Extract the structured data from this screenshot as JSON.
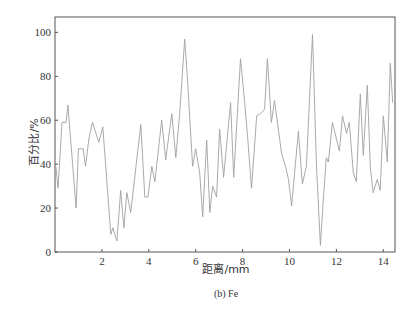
{
  "chart_data": {
    "type": "line",
    "title": "",
    "caption": "(b) Fe",
    "xlabel": "距离/mm",
    "ylabel": "百分比/%",
    "xlim": [
      0,
      14.5
    ],
    "ylim": [
      0,
      107
    ],
    "xticks": [
      2,
      4,
      6,
      8,
      10,
      12,
      14
    ],
    "yticks": [
      0,
      20,
      40,
      60,
      80,
      100
    ],
    "grid": false,
    "legend": null,
    "line_color": "#a0a0a0",
    "axis_color": "#555555",
    "series": [
      {
        "name": "Fe",
        "x": [
          0.04,
          0.13,
          0.3,
          0.47,
          0.55,
          0.9,
          1.0,
          1.2,
          1.3,
          1.45,
          1.6,
          1.87,
          2.04,
          2.38,
          2.47,
          2.64,
          2.8,
          2.94,
          3.06,
          3.23,
          3.66,
          3.83,
          3.96,
          4.13,
          4.26,
          4.55,
          4.72,
          4.98,
          5.15,
          5.32,
          5.53,
          5.66,
          5.87,
          6.0,
          6.17,
          6.3,
          6.47,
          6.6,
          6.72,
          6.89,
          7.02,
          7.19,
          7.49,
          7.62,
          7.91,
          8.09,
          8.21,
          8.38,
          8.6,
          8.77,
          8.94,
          9.06,
          9.23,
          9.36,
          9.66,
          9.83,
          9.96,
          10.09,
          10.38,
          10.55,
          10.72,
          10.98,
          11.15,
          11.32,
          11.45,
          11.57,
          11.66,
          11.83,
          12.13,
          12.26,
          12.43,
          12.55,
          12.72,
          12.85,
          13.02,
          13.15,
          13.32,
          13.45,
          13.57,
          13.74,
          13.87,
          14.0,
          14.17,
          14.3,
          14.4
        ],
        "y": [
          39,
          29,
          59,
          59,
          67,
          20,
          47,
          47,
          39,
          52,
          59,
          50,
          57,
          8,
          11,
          5,
          28,
          11,
          27,
          18,
          58,
          25,
          25,
          39,
          32,
          60,
          42,
          63,
          43,
          63,
          97,
          77,
          39,
          47,
          36,
          16,
          51,
          18,
          30,
          25,
          56,
          34,
          68,
          34,
          88,
          68,
          53,
          29,
          62,
          63,
          65,
          88,
          59,
          69,
          45,
          39,
          33,
          21,
          55,
          31,
          39,
          99,
          40,
          3,
          25,
          43,
          41,
          59,
          46,
          62,
          54,
          59,
          36,
          32,
          72,
          44,
          76,
          38,
          27,
          33,
          28,
          62,
          41,
          86,
          68
        ]
      }
    ]
  }
}
